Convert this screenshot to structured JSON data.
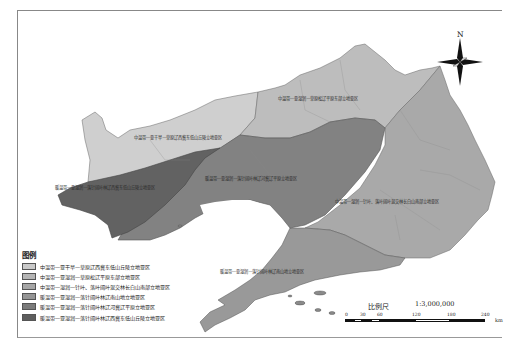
{
  "map": {
    "legend": {
      "title": "图例",
      "items": [
        {
          "label": "中温带—亚干旱—草原辽西冀东低山丘陵立地亚区",
          "color": "#c9c9c9"
        },
        {
          "label": "中温带—亚湿润—草原松辽平原东部立地亚区",
          "color": "#b5b5b5"
        },
        {
          "label": "中温带—湿润—针叶、落叶阔叶混交林长白山南部立地亚区",
          "color": "#a6a6a6"
        },
        {
          "label": "暖温带—亚湿润—落针阔叶林辽南山地立地亚区",
          "color": "#959595"
        },
        {
          "label": "暖温带—亚湿润—落针阔叶林辽河冀辽平原立地亚区",
          "color": "#7b7b7b"
        },
        {
          "label": "暖温带—亚湿润—落针阔叶林辽西冀东低山丘陵立地亚区",
          "color": "#5e5e5e"
        }
      ]
    },
    "region_labels": [
      "中温带—亚湿润—草原松辽平原东部立地亚区",
      "中温带—亚干旱—草原辽西冀东低山丘陵立地亚区",
      "暖温带—亚湿润—落针阔叶林辽西冀东低山丘陵立地亚区",
      "暖温带—亚湿润—落针阔叶林辽河冀辽平原立地亚区",
      "中温带—湿润—针叶、落叶阔叶混交林长白山南部立地亚区",
      "暖温带—亚湿润—落针阔叶林辽南山地立地亚区"
    ],
    "north_arrow": {
      "label": "N",
      "icon": "compass-rose-icon"
    },
    "scale": {
      "title": "比例尺",
      "ratio": "1:3,000,000",
      "ticks": [
        "0",
        "30",
        "60",
        "120",
        "180",
        "240"
      ],
      "unit": "km"
    }
  }
}
